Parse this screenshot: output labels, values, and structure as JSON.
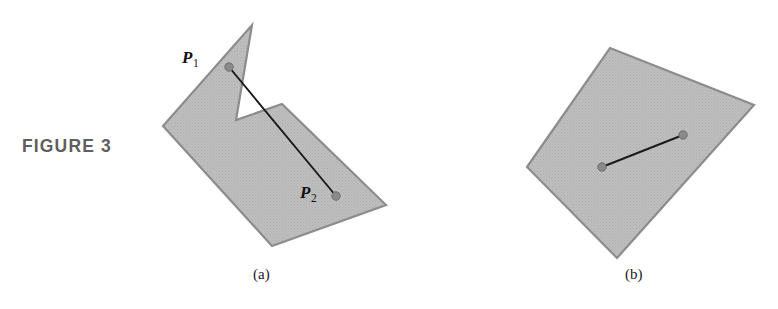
{
  "figure": {
    "label": "FIGURE 3",
    "label_color": "#5f5f5f"
  },
  "panels": [
    {
      "id": "a",
      "caption": "(a)",
      "kind": "non-convex-polygon",
      "description": "Non-convex polygon with segment between two interior points passing outside the region",
      "point_labels": [
        {
          "name": "P1",
          "text": "P",
          "subscript": "1"
        },
        {
          "name": "P2",
          "text": "P",
          "subscript": "2"
        }
      ]
    },
    {
      "id": "b",
      "caption": "(b)",
      "kind": "convex-polygon",
      "description": "Convex polygon with segment between two interior points contained in the region",
      "point_labels": []
    }
  ],
  "colors": {
    "polygon_fill": "#bcbcbc",
    "polygon_stroke": "#8c8c8c",
    "segment_stroke": "#1a1a1a",
    "point_marker": "#8a8a8a",
    "point_marker_stroke": "#6f6f6f",
    "caption_text": "#1b1b1b",
    "background": "#ffffff"
  },
  "geometry": {
    "panel_a": {
      "polygon_points": "252,25 236,120 282,104 386,205 272,246 163,126",
      "segment": {
        "x1": 229,
        "y1": 67,
        "x2": 336,
        "y2": 196
      },
      "markers": [
        {
          "name": "point-p1-marker",
          "cx": 229,
          "cy": 67,
          "r": 4.2
        },
        {
          "name": "point-p2-marker",
          "cx": 336,
          "cy": 196,
          "r": 4.2
        }
      ]
    },
    "panel_b": {
      "polygon_points": "610,48 754,105 617,258 527,167",
      "segment": {
        "x1": 602,
        "y1": 167,
        "x2": 683,
        "y2": 135
      },
      "markers": [
        {
          "name": "point-b1-marker",
          "cx": 602,
          "cy": 167,
          "r": 4.2
        },
        {
          "name": "point-b2-marker",
          "cx": 683,
          "cy": 135,
          "r": 4.2
        }
      ]
    }
  }
}
